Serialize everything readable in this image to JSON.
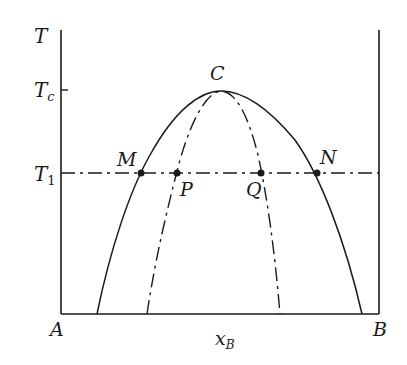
{
  "diagram": {
    "type": "phase-diagram-binary-miscibility-gap",
    "axes": {
      "y_label": "T",
      "x_label_main": "x",
      "x_label_sub": "B",
      "left_end_label": "A",
      "right_end_label": "B",
      "y_ticks": [
        {
          "label_main": "T",
          "label_sub": "c",
          "meaning": "critical temperature"
        },
        {
          "label_main": "T",
          "label_sub": "1",
          "meaning": "temperature T1"
        }
      ]
    },
    "curves": [
      {
        "name": "binodal",
        "style": "solid"
      },
      {
        "name": "spinodal",
        "style": "dash-dot"
      },
      {
        "name": "isotherm-T1",
        "style": "dash-dot"
      }
    ],
    "points": [
      {
        "label": "C",
        "meaning": "critical point"
      },
      {
        "label": "M",
        "meaning": "binodal left at T1"
      },
      {
        "label": "P",
        "meaning": "spinodal left at T1"
      },
      {
        "label": "Q",
        "meaning": "spinodal right at T1"
      },
      {
        "label": "N",
        "meaning": "binodal right at T1"
      }
    ],
    "colors": {
      "ink": "#1a1a1a",
      "background": "#ffffff"
    }
  }
}
